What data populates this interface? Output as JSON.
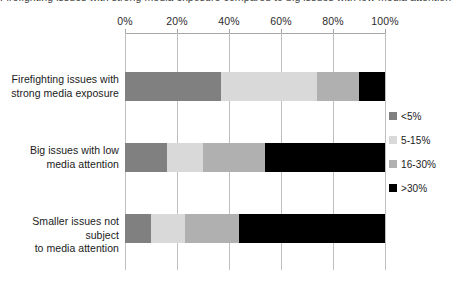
{
  "chart_data": {
    "type": "bar",
    "orientation": "horizontal",
    "stacked": true,
    "normalized": true,
    "title": "Firefighting issues with strong media exposure compared to big issues with low media attention (percentage)",
    "xlabel": "",
    "ylabel": "",
    "xlim": [
      0,
      100
    ],
    "xticks": [
      0,
      20,
      40,
      60,
      80,
      100
    ],
    "xtick_labels": [
      "0%",
      "20%",
      "40%",
      "60%",
      "80%",
      "100%"
    ],
    "grid": "vertical",
    "axis_position": "top",
    "legend_position": "right",
    "categories": [
      "Firefighting issues with strong media exposure",
      "Big issues with low media attention",
      "Smaller issues not subject to media attention"
    ],
    "category_lines": [
      [
        "Firefighting issues with",
        "strong media exposure"
      ],
      [
        "Big issues with low",
        "media attention"
      ],
      [
        "Smaller issues not subject",
        "to media attention"
      ]
    ],
    "series": [
      {
        "name": "<5%",
        "color": "#808080",
        "values": [
          37,
          16,
          10
        ]
      },
      {
        "name": "5-15%",
        "color": "#d9d9d9",
        "values": [
          37,
          14,
          13
        ]
      },
      {
        "name": "16-30%",
        "color": "#b0b0b0",
        "values": [
          16,
          24,
          21
        ]
      },
      {
        "name": ">30%",
        "color": "#000000",
        "values": [
          10,
          46,
          56
        ]
      }
    ]
  },
  "legend": {
    "items": [
      {
        "label": "<5%",
        "color": "#808080"
      },
      {
        "label": "5-15%",
        "color": "#d9d9d9"
      },
      {
        "label": "16-30%",
        "color": "#b0b0b0"
      },
      {
        "label": ">30%",
        "color": "#000000"
      }
    ]
  }
}
